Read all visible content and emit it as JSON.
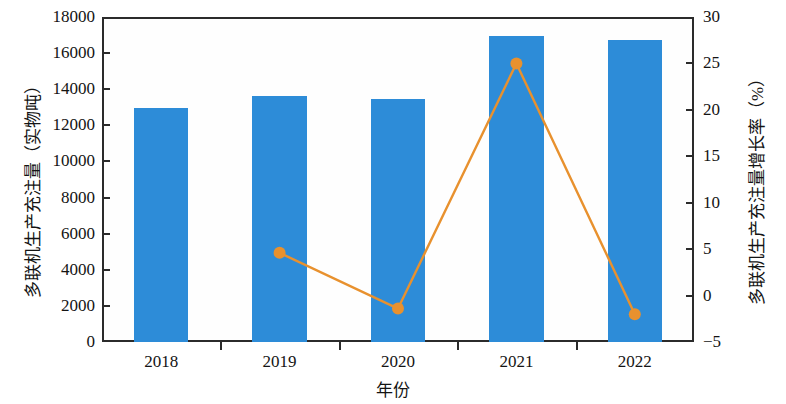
{
  "chart_data": {
    "type": "bar",
    "title": "",
    "xlabel": "年份",
    "ylabel": "多联机生产充注量（实物吨）",
    "y2label": "多联机生产充注量增长率（%）",
    "categories": [
      "2018",
      "2019",
      "2020",
      "2021",
      "2022"
    ],
    "series": [
      {
        "name": "多联机生产充注量（实物吨）",
        "type": "bar",
        "axis": "left",
        "color": "#2d8cd8",
        "values": [
          12950,
          13650,
          13450,
          16950,
          16700
        ]
      },
      {
        "name": "多联机生产充注量增长率（%）",
        "type": "line",
        "axis": "right",
        "color": "#e8912e",
        "values": [
          null,
          4.6,
          -1.4,
          25.0,
          -2.0
        ]
      }
    ],
    "ylim": [
      0,
      18000
    ],
    "yticks": [
      0,
      2000,
      4000,
      6000,
      8000,
      10000,
      12000,
      14000,
      16000,
      18000
    ],
    "ytick_labels": [
      "0",
      "2000",
      "4000",
      "6000",
      "8000",
      "10000",
      "12000",
      "14000",
      "16000",
      "18000"
    ],
    "y2lim": [
      -5,
      30
    ],
    "y2ticks": [
      -5,
      0,
      5,
      10,
      15,
      20,
      25,
      30
    ],
    "y2tick_labels": [
      "−5",
      "0",
      "5",
      "10",
      "15",
      "20",
      "25",
      "30"
    ],
    "grid": false,
    "legend": null
  }
}
